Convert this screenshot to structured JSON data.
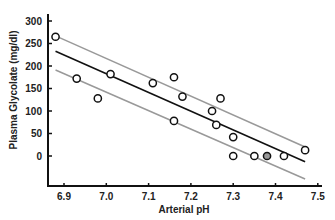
{
  "chart_data": {
    "type": "scatter",
    "title": "",
    "xlabel": "Arterial pH",
    "ylabel": "Plasma Glycolate (mg/dl)",
    "xlim": [
      6.87,
      7.52
    ],
    "ylim": [
      -80,
      310
    ],
    "x_ticks": [
      6.9,
      7.0,
      7.1,
      7.2,
      7.3,
      7.4,
      7.5
    ],
    "x_tick_labels": [
      "6.9",
      "7.0",
      "7.1",
      "7.2",
      "7.3",
      "7.4",
      "7.5"
    ],
    "y_ticks": [
      0,
      50,
      100,
      150,
      200,
      250,
      300
    ],
    "y_tick_labels": [
      "0",
      "50",
      "100",
      "150",
      "200",
      "250",
      "300"
    ],
    "grid": false,
    "legend": null,
    "series": [
      {
        "name": "Observations",
        "marker": "open-circle",
        "x": [
          6.88,
          6.93,
          6.98,
          7.01,
          7.11,
          7.16,
          7.18,
          7.16,
          7.27,
          7.25,
          7.26,
          7.3,
          7.3,
          7.35,
          7.38,
          7.42,
          7.47
        ],
        "y": [
          265,
          172,
          128,
          182,
          162,
          175,
          132,
          78,
          128,
          100,
          69,
          42,
          0,
          0,
          0,
          0,
          13
        ],
        "fill": [
          "none",
          "none",
          "none",
          "none",
          "none",
          "none",
          "none",
          "none",
          "none",
          "none",
          "none",
          "none",
          "none",
          "none",
          "#999999",
          "none",
          "none"
        ]
      },
      {
        "name": "Regression line",
        "kind": "line",
        "color": "#111111",
        "x": [
          6.88,
          7.47
        ],
        "y": [
          233,
          -13
        ]
      },
      {
        "name": "Upper confidence bound",
        "kind": "line",
        "color": "#999999",
        "x": [
          6.88,
          7.47
        ],
        "y": [
          267,
          20
        ]
      },
      {
        "name": "Lower confidence bound",
        "kind": "line",
        "color": "#999999",
        "x": [
          6.88,
          7.47
        ],
        "y": [
          191,
          -51
        ]
      }
    ]
  },
  "layout": {
    "x_px": {
      "origin_val": 6.9,
      "origin_px": 64,
      "px_per_unit": 423
    },
    "y_px": {
      "origin_val": 0,
      "origin_px": 156,
      "px_per_unit": 0.45
    },
    "axis_left": 48,
    "axis_bottom": 186,
    "axis_right": 322,
    "axis_top": 14
  }
}
